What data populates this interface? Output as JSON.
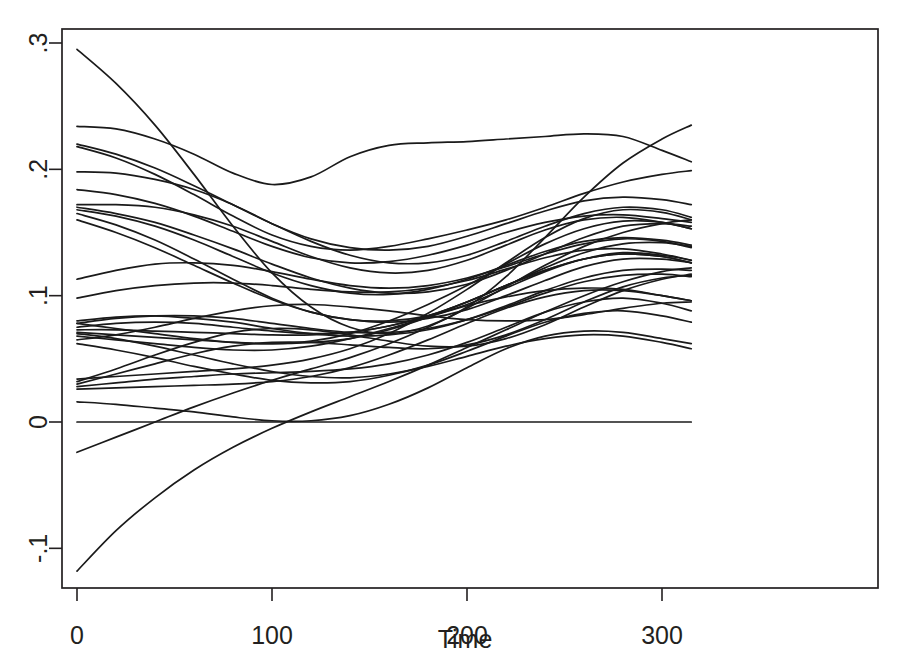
{
  "chart_data": {
    "type": "line",
    "title": "",
    "subtitle": "",
    "xlabel": "Time",
    "ylabel": "",
    "xlim": [
      0,
      315
    ],
    "ylim": [
      -0.13,
      0.305
    ],
    "grid": false,
    "legend": false,
    "legend_position": "none",
    "x_ticks": [
      0,
      100,
      200,
      300
    ],
    "x_tick_labels": [
      "0",
      "100",
      "200",
      "300"
    ],
    "y_ticks": [
      -0.1,
      0,
      0.1,
      0.2,
      0.3
    ],
    "y_tick_labels": [
      "-.1",
      "0",
      ".1",
      ".2",
      ".3"
    ],
    "y_tick_label_rotation": -90,
    "n_series": 24,
    "x": [
      0,
      20,
      40,
      60,
      80,
      100,
      120,
      140,
      160,
      180,
      200,
      220,
      240,
      260,
      280,
      300,
      315
    ],
    "series": [
      {
        "name": "curve-01",
        "values": [
          0.295,
          0.268,
          0.235,
          0.196,
          0.155,
          0.118,
          0.091,
          0.075,
          0.07,
          0.076,
          0.091,
          0.115,
          0.146,
          0.178,
          0.205,
          0.224,
          0.235
        ]
      },
      {
        "name": "curve-02",
        "values": [
          0.234,
          0.232,
          0.224,
          0.212,
          0.197,
          0.188,
          0.194,
          0.21,
          0.219,
          0.221,
          0.222,
          0.224,
          0.226,
          0.228,
          0.226,
          0.215,
          0.206
        ]
      },
      {
        "name": "curve-03",
        "values": [
          0.218,
          0.209,
          0.196,
          0.18,
          0.163,
          0.148,
          0.139,
          0.136,
          0.139,
          0.145,
          0.152,
          0.16,
          0.17,
          0.181,
          0.19,
          0.196,
          0.199
        ]
      },
      {
        "name": "curve-04",
        "values": [
          0.198,
          0.197,
          0.192,
          0.184,
          0.172,
          0.157,
          0.143,
          0.132,
          0.126,
          0.126,
          0.132,
          0.143,
          0.155,
          0.165,
          0.17,
          0.168,
          0.162
        ]
      },
      {
        "name": "curve-05",
        "values": [
          0.184,
          0.18,
          0.173,
          0.163,
          0.151,
          0.139,
          0.13,
          0.126,
          0.127,
          0.132,
          0.14,
          0.15,
          0.158,
          0.163,
          0.164,
          0.161,
          0.158
        ]
      },
      {
        "name": "curve-06",
        "values": [
          0.172,
          0.172,
          0.17,
          0.164,
          0.155,
          0.143,
          0.131,
          0.122,
          0.118,
          0.12,
          0.128,
          0.14,
          0.152,
          0.16,
          0.162,
          0.158,
          0.153
        ]
      },
      {
        "name": "curve-07",
        "values": [
          0.168,
          0.163,
          0.155,
          0.144,
          0.131,
          0.118,
          0.108,
          0.102,
          0.101,
          0.105,
          0.113,
          0.124,
          0.135,
          0.143,
          0.146,
          0.144,
          0.14
        ]
      },
      {
        "name": "curve-08",
        "values": [
          0.165,
          0.156,
          0.144,
          0.129,
          0.113,
          0.098,
          0.087,
          0.081,
          0.08,
          0.084,
          0.093,
          0.106,
          0.119,
          0.129,
          0.134,
          0.132,
          0.128
        ]
      },
      {
        "name": "curve-09",
        "values": [
          0.113,
          0.12,
          0.125,
          0.126,
          0.124,
          0.119,
          0.113,
          0.108,
          0.106,
          0.108,
          0.114,
          0.123,
          0.133,
          0.141,
          0.145,
          0.143,
          0.138
        ]
      },
      {
        "name": "curve-10",
        "values": [
          0.098,
          0.104,
          0.108,
          0.11,
          0.11,
          0.108,
          0.105,
          0.103,
          0.103,
          0.106,
          0.112,
          0.121,
          0.13,
          0.136,
          0.137,
          0.133,
          0.128
        ]
      },
      {
        "name": "curve-11",
        "values": [
          0.08,
          0.083,
          0.084,
          0.082,
          0.079,
          0.074,
          0.07,
          0.068,
          0.069,
          0.073,
          0.081,
          0.092,
          0.104,
          0.114,
          0.12,
          0.121,
          0.12
        ]
      },
      {
        "name": "curve-12",
        "values": [
          0.078,
          0.082,
          0.084,
          0.084,
          0.082,
          0.078,
          0.074,
          0.071,
          0.071,
          0.074,
          0.081,
          0.091,
          0.102,
          0.111,
          0.116,
          0.117,
          0.115
        ]
      },
      {
        "name": "curve-13",
        "values": [
          0.075,
          0.078,
          0.079,
          0.078,
          0.075,
          0.072,
          0.07,
          0.071,
          0.076,
          0.084,
          0.095,
          0.108,
          0.12,
          0.129,
          0.133,
          0.131,
          0.126
        ]
      },
      {
        "name": "curve-14",
        "values": [
          0.073,
          0.073,
          0.072,
          0.071,
          0.07,
          0.069,
          0.069,
          0.071,
          0.076,
          0.084,
          0.095,
          0.108,
          0.122,
          0.134,
          0.141,
          0.142,
          0.139
        ]
      },
      {
        "name": "curve-15",
        "values": [
          0.071,
          0.069,
          0.067,
          0.065,
          0.063,
          0.062,
          0.063,
          0.066,
          0.073,
          0.083,
          0.095,
          0.108,
          0.12,
          0.129,
          0.133,
          0.131,
          0.126
        ]
      },
      {
        "name": "curve-16",
        "values": [
          0.068,
          0.065,
          0.062,
          0.059,
          0.057,
          0.057,
          0.06,
          0.066,
          0.074,
          0.083,
          0.092,
          0.099,
          0.104,
          0.106,
          0.105,
          0.1,
          0.096
        ]
      },
      {
        "name": "curve-17",
        "values": [
          0.065,
          0.069,
          0.075,
          0.082,
          0.088,
          0.092,
          0.093,
          0.091,
          0.088,
          0.084,
          0.081,
          0.08,
          0.081,
          0.085,
          0.09,
          0.094,
          0.095
        ]
      },
      {
        "name": "curve-18",
        "values": [
          0.032,
          0.042,
          0.053,
          0.063,
          0.071,
          0.074,
          0.073,
          0.069,
          0.064,
          0.06,
          0.06,
          0.066,
          0.077,
          0.091,
          0.104,
          0.113,
          0.117
        ]
      },
      {
        "name": "curve-19",
        "values": [
          0.03,
          0.038,
          0.046,
          0.054,
          0.06,
          0.063,
          0.063,
          0.061,
          0.059,
          0.058,
          0.061,
          0.069,
          0.081,
          0.095,
          0.107,
          0.114,
          0.116
        ]
      },
      {
        "name": "curve-20",
        "values": [
          0.028,
          0.031,
          0.034,
          0.036,
          0.038,
          0.039,
          0.04,
          0.042,
          0.046,
          0.053,
          0.063,
          0.075,
          0.087,
          0.095,
          0.098,
          0.094,
          0.088
        ]
      },
      {
        "name": "curve-21",
        "values": [
          0.026,
          0.027,
          0.028,
          0.029,
          0.03,
          0.032,
          0.036,
          0.043,
          0.053,
          0.065,
          0.078,
          0.09,
          0.099,
          0.104,
          0.104,
          0.1,
          0.096
        ]
      },
      {
        "name": "curve-22",
        "values": [
          0.016,
          0.014,
          0.011,
          0.008,
          0.004,
          0.001,
          0.001,
          0.005,
          0.014,
          0.027,
          0.043,
          0.058,
          0.068,
          0.072,
          0.071,
          0.066,
          0.062
        ]
      },
      {
        "name": "curve-23",
        "values": [
          0.0,
          0.0,
          0.0,
          0.0,
          0.0,
          0.0,
          0.0,
          0.0,
          0.0,
          0.0,
          0.0,
          0.0,
          0.0,
          0.0,
          0.0,
          0.0,
          0.0
        ]
      },
      {
        "name": "curve-24",
        "values": [
          -0.024,
          -0.012,
          0.0,
          0.012,
          0.023,
          0.033,
          0.042,
          0.051,
          0.062,
          0.075,
          0.09,
          0.107,
          0.124,
          0.139,
          0.15,
          0.157,
          0.16
        ]
      },
      {
        "name": "curve-25",
        "values": [
          -0.118,
          -0.086,
          -0.06,
          -0.038,
          -0.02,
          -0.005,
          0.008,
          0.02,
          0.032,
          0.045,
          0.059,
          0.073,
          0.087,
          0.1,
          0.111,
          0.119,
          0.122
        ]
      },
      {
        "name": "curve-26",
        "values": [
          0.22,
          0.212,
          0.201,
          0.187,
          0.172,
          0.157,
          0.145,
          0.138,
          0.136,
          0.139,
          0.147,
          0.157,
          0.167,
          0.175,
          0.178,
          0.176,
          0.172
        ]
      },
      {
        "name": "curve-27",
        "values": [
          0.16,
          0.15,
          0.138,
          0.124,
          0.11,
          0.097,
          0.087,
          0.081,
          0.079,
          0.082,
          0.089,
          0.1,
          0.112,
          0.123,
          0.129,
          0.129,
          0.126
        ]
      },
      {
        "name": "curve-28",
        "values": [
          0.078,
          0.074,
          0.07,
          0.066,
          0.063,
          0.062,
          0.064,
          0.07,
          0.08,
          0.093,
          0.108,
          0.125,
          0.141,
          0.153,
          0.159,
          0.158,
          0.153
        ]
      },
      {
        "name": "curve-29",
        "values": [
          0.034,
          0.036,
          0.038,
          0.04,
          0.042,
          0.045,
          0.05,
          0.058,
          0.07,
          0.086,
          0.105,
          0.126,
          0.146,
          0.161,
          0.168,
          0.166,
          0.16
        ]
      },
      {
        "name": "curve-30",
        "values": [
          0.07,
          0.066,
          0.06,
          0.053,
          0.046,
          0.04,
          0.036,
          0.035,
          0.038,
          0.044,
          0.052,
          0.06,
          0.066,
          0.069,
          0.068,
          0.063,
          0.058
        ]
      },
      {
        "name": "curve-31",
        "values": [
          0.062,
          0.057,
          0.051,
          0.044,
          0.038,
          0.033,
          0.031,
          0.032,
          0.037,
          0.045,
          0.056,
          0.068,
          0.079,
          0.086,
          0.088,
          0.084,
          0.079
        ]
      },
      {
        "name": "curve-32",
        "values": [
          0.17,
          0.165,
          0.158,
          0.148,
          0.137,
          0.125,
          0.114,
          0.106,
          0.102,
          0.103,
          0.109,
          0.12,
          0.133,
          0.146,
          0.155,
          0.157,
          0.155
        ]
      }
    ]
  },
  "axes": {
    "x_title": "Time",
    "y_title": ""
  }
}
